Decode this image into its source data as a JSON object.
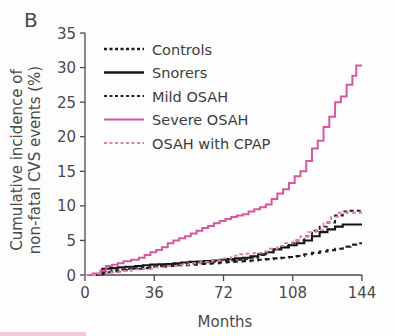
{
  "panel": {
    "label": "B"
  },
  "chart_data": {
    "type": "line",
    "title": "",
    "xlabel": "Months",
    "ylabel": "Cumulative incidence of non-fatal CVS events (%)",
    "ylabel_line1": "Cumulative incidence of",
    "ylabel_line2": "non-fatal CVS events (%)",
    "xlim": [
      0,
      144
    ],
    "ylim": [
      0,
      35
    ],
    "xticks": [
      0,
      36,
      72,
      108,
      144
    ],
    "yticks": [
      0,
      5,
      10,
      15,
      20,
      25,
      30,
      35
    ],
    "xtick_labels": [
      "0",
      "36",
      "72",
      "108",
      "144"
    ],
    "ytick_labels": [
      "0",
      "5",
      "10",
      "15",
      "20",
      "25",
      "30",
      "35"
    ],
    "grid": false,
    "legend_position": "upper-left-inside",
    "step_type": "post",
    "series": [
      {
        "name": "Controls",
        "color": "#1c1c1c",
        "style": "dashed",
        "dash_pattern": "5,3.5",
        "width": 2.1,
        "final_value": 4.6,
        "x": [
          0,
          6,
          10,
          14,
          18,
          24,
          30,
          36,
          42,
          48,
          54,
          58,
          62,
          66,
          70,
          74,
          78,
          82,
          86,
          90,
          94,
          98,
          102,
          106,
          110,
          114,
          118,
          122,
          126,
          130,
          134,
          138,
          142,
          144
        ],
        "y": [
          0,
          0.15,
          0.4,
          0.5,
          0.7,
          0.9,
          1.0,
          1.2,
          1.3,
          1.4,
          1.5,
          1.6,
          1.65,
          1.7,
          1.8,
          1.9,
          1.95,
          2.0,
          2.1,
          2.2,
          2.3,
          2.4,
          2.5,
          2.6,
          2.75,
          3.0,
          3.2,
          3.4,
          3.6,
          3.8,
          4.1,
          4.4,
          4.6,
          4.6
        ]
      },
      {
        "name": "Snorers",
        "color": "#151515",
        "style": "solid",
        "dash_pattern": "none",
        "width": 2.1,
        "final_value": 7.3,
        "x": [
          0,
          5,
          9,
          13,
          17,
          21,
          26,
          30,
          34,
          38,
          42,
          46,
          50,
          54,
          58,
          62,
          66,
          70,
          74,
          78,
          82,
          86,
          90,
          94,
          98,
          102,
          106,
          110,
          114,
          118,
          122,
          126,
          130,
          134,
          144
        ],
        "y": [
          0,
          0.1,
          0.9,
          1.0,
          1.1,
          1.2,
          1.3,
          1.4,
          1.5,
          1.55,
          1.6,
          1.7,
          1.8,
          1.9,
          1.95,
          2.0,
          2.1,
          2.2,
          2.3,
          2.4,
          2.5,
          2.7,
          3.0,
          3.3,
          3.7,
          4.0,
          4.3,
          4.6,
          5.0,
          5.6,
          6.2,
          6.6,
          7.0,
          7.3,
          7.3
        ]
      },
      {
        "name": "Mild OSAH",
        "color": "#222222",
        "style": "dashed",
        "dash_pattern": "4,3",
        "width": 1.9,
        "final_value": 9.3,
        "x": [
          0,
          6,
          10,
          14,
          18,
          22,
          26,
          30,
          34,
          38,
          42,
          46,
          50,
          54,
          58,
          62,
          66,
          70,
          74,
          78,
          82,
          86,
          90,
          94,
          98,
          102,
          106,
          110,
          114,
          118,
          122,
          126,
          130,
          134,
          138,
          144
        ],
        "y": [
          0,
          0.1,
          0.5,
          0.7,
          0.8,
          0.9,
          1.0,
          1.1,
          1.2,
          1.3,
          1.4,
          1.5,
          1.6,
          1.7,
          1.8,
          1.85,
          1.9,
          2.0,
          2.1,
          2.2,
          2.3,
          2.5,
          2.9,
          3.3,
          3.8,
          4.2,
          4.6,
          5.0,
          5.6,
          6.4,
          7.0,
          7.6,
          8.6,
          9.2,
          9.3,
          9.3
        ]
      },
      {
        "name": "Severe OSAH",
        "color": "#d6589f",
        "style": "solid",
        "dash_pattern": "none",
        "width": 2.0,
        "final_value": 30.3,
        "x": [
          0,
          4,
          8,
          11,
          14,
          17,
          20,
          24,
          28,
          31,
          34,
          37,
          40,
          43,
          46,
          49,
          52,
          55,
          58,
          61,
          64,
          67,
          70,
          73,
          76,
          79,
          82,
          85,
          88,
          91,
          94,
          97,
          100,
          103,
          106,
          109,
          112,
          115,
          118,
          121,
          124,
          127,
          130,
          133,
          136,
          139,
          141,
          144
        ],
        "y": [
          0,
          0.2,
          0.6,
          1.3,
          1.5,
          1.7,
          2.0,
          2.2,
          2.5,
          2.9,
          3.3,
          3.6,
          4.0,
          4.6,
          5.0,
          5.3,
          5.6,
          6.0,
          6.4,
          6.8,
          7.1,
          7.5,
          7.8,
          8.1,
          8.4,
          8.6,
          8.8,
          9.2,
          9.5,
          9.8,
          10.2,
          11.0,
          11.8,
          12.4,
          13.3,
          14.3,
          15.0,
          16.5,
          18.3,
          19.4,
          21.4,
          22.9,
          25.0,
          25.8,
          27.5,
          28.8,
          30.3,
          30.3
        ]
      },
      {
        "name": "OSAH with CPAP",
        "color": "#e07fb3",
        "style": "dashed",
        "dash_pattern": "4,3",
        "width": 1.8,
        "final_value": 9.0,
        "x": [
          0,
          6,
          12,
          18,
          24,
          30,
          36,
          42,
          48,
          54,
          60,
          66,
          72,
          76,
          80,
          84,
          88,
          92,
          96,
          100,
          104,
          108,
          112,
          116,
          120,
          124,
          128,
          132,
          136,
          140,
          144
        ],
        "y": [
          0,
          0.2,
          0.4,
          0.6,
          0.8,
          0.9,
          1.1,
          1.3,
          1.5,
          1.7,
          1.9,
          2.1,
          2.4,
          2.8,
          3.0,
          3.1,
          3.2,
          3.4,
          3.8,
          4.2,
          4.6,
          5.0,
          5.6,
          6.2,
          6.5,
          7.6,
          8.4,
          9.0,
          9.0,
          9.0,
          9.0
        ]
      }
    ],
    "legend_entries": [
      {
        "label": "Controls",
        "color": "#1c1c1c",
        "style": "dashed",
        "dash_pattern": "3,2.5",
        "width": 2.4
      },
      {
        "label": "Snorers",
        "color": "#151515",
        "style": "solid",
        "dash_pattern": "none",
        "width": 2.6
      },
      {
        "label": "Mild OSAH",
        "color": "#222222",
        "style": "dashed",
        "dash_pattern": "3,2.5",
        "width": 2.2
      },
      {
        "label": "Severe OSAH",
        "color": "#d6589f",
        "style": "solid",
        "dash_pattern": "none",
        "width": 2.2
      },
      {
        "label": "OSAH with CPAP",
        "color": "#e07fb3",
        "style": "dashed",
        "dash_pattern": "3,2.5",
        "width": 1.9
      }
    ]
  }
}
